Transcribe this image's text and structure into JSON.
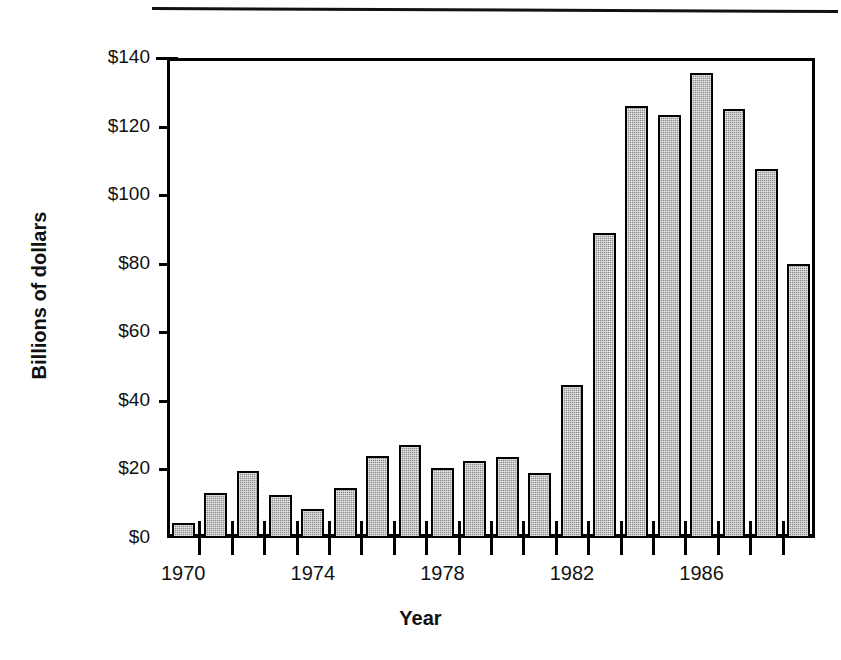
{
  "figure": {
    "background_color": "#ffffff",
    "frame_color": "#000000",
    "bar_fill_color": "#8c8c8c",
    "bar_edge_color": "#000000",
    "has_top_rule": true
  },
  "chart_data": {
    "type": "bar",
    "title": "",
    "subtitle": "",
    "xlabel": "Year",
    "ylabel": "Billions of dollars",
    "categories": [
      "1970",
      "1971",
      "1972",
      "1973",
      "1974",
      "1975",
      "1976",
      "1977",
      "1978",
      "1979",
      "1980",
      "1981",
      "1982",
      "1983",
      "1984",
      "1985",
      "1986",
      "1987",
      "1988",
      "1989"
    ],
    "values": [
      4.5,
      13,
      19.5,
      12.5,
      8.5,
      14.5,
      24,
      27,
      20.5,
      22.5,
      23.5,
      19,
      44.5,
      89,
      126,
      123.5,
      135.5,
      125,
      107.5,
      80
    ],
    "ylim": [
      0,
      140
    ],
    "yticks": [
      0,
      20,
      40,
      60,
      80,
      100,
      120,
      140
    ],
    "ytick_labels": [
      "$0",
      "$20",
      "$40",
      "$60",
      "$80",
      "$100",
      "$120",
      "$140"
    ],
    "xtick_labels": [
      "1970",
      "1974",
      "1978",
      "1982",
      "1986"
    ],
    "xtick_label_categories": [
      "1970",
      "1974",
      "1978",
      "1982",
      "1986"
    ],
    "grid": false,
    "legend": null,
    "legend_position": "none",
    "annotations": []
  }
}
